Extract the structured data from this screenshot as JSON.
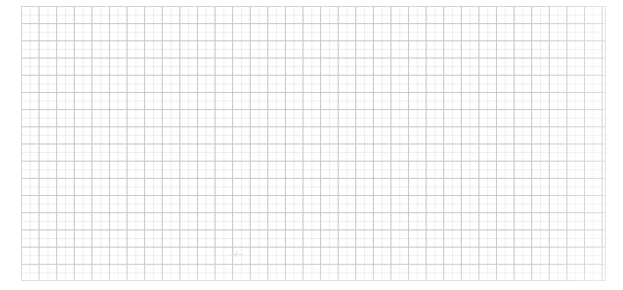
{
  "app": {
    "kind": "blank-grid-canvas",
    "background_color": "#ffffff"
  },
  "canvas": {
    "width": 623,
    "height": 290
  },
  "grid": {
    "origin_x": 21,
    "origin_y": 6,
    "width": 585,
    "height": 275,
    "cell_width": 17.6,
    "cell_height": 17.2,
    "columns": 33,
    "rows": 16,
    "line_color": "#c9c9c9",
    "minor_line_color": "#ededed",
    "line_width": 1,
    "border_color": "#d4d4d4",
    "fill_color": "#ffffff"
  },
  "artifacts": {
    "smudge": {
      "x": 231,
      "y": 250,
      "width": 13,
      "height": 9,
      "color": "#dcdcdc"
    }
  },
  "content": {
    "title": "",
    "status": "",
    "notes": ""
  }
}
